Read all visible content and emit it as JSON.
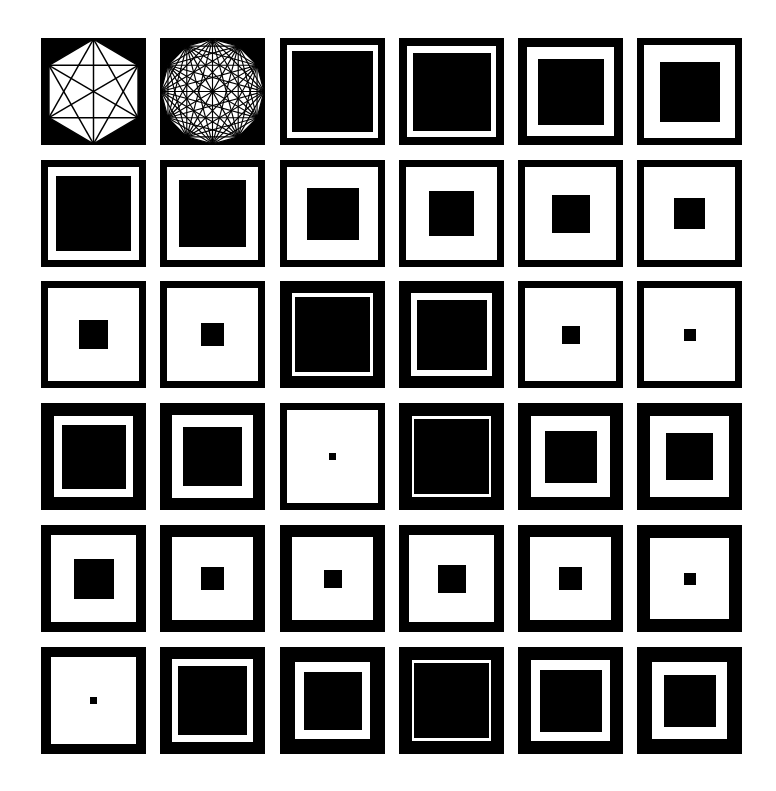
{
  "figure": {
    "title": "",
    "colors": {
      "ink": "#000000",
      "paper": "#ffffff"
    },
    "layout": {
      "col_x": [
        41,
        160,
        280,
        399,
        518,
        637
      ],
      "row_y": [
        38,
        160,
        281,
        403,
        525,
        647
      ],
      "cell_w": 105,
      "cell_h": 107
    },
    "cells": [
      [
        {
          "type": "polygon",
          "sides": 6,
          "label": "hexagon-with-diagonals"
        },
        {
          "type": "polygon",
          "sides": 12,
          "label": "dodecagon-with-diagonals"
        },
        {
          "type": "square",
          "border": 7,
          "inner": 81
        },
        {
          "type": "square",
          "border": 8,
          "inner": 78
        },
        {
          "type": "square",
          "border": 9,
          "inner": 66
        },
        {
          "type": "square",
          "border": 7,
          "inner": 60
        }
      ],
      [
        {
          "type": "square",
          "border": 7,
          "inner": 75
        },
        {
          "type": "square",
          "border": 7,
          "inner": 67
        },
        {
          "type": "square",
          "border": 7,
          "inner": 52
        },
        {
          "type": "square",
          "border": 7,
          "inner": 45
        },
        {
          "type": "square",
          "border": 7,
          "inner": 38
        },
        {
          "type": "square",
          "border": 7,
          "inner": 31
        }
      ],
      [
        {
          "type": "square",
          "border": 7,
          "inner": 29
        },
        {
          "type": "square",
          "border": 7,
          "inner": 23
        },
        {
          "type": "square",
          "border": 12,
          "inner": 75
        },
        {
          "type": "square",
          "border": 12,
          "inner": 70
        },
        {
          "type": "square",
          "border": 7,
          "inner": 18
        },
        {
          "type": "square",
          "border": 7,
          "inner": 12
        }
      ],
      [
        {
          "type": "square",
          "border": 13,
          "inner": 64
        },
        {
          "type": "square",
          "border": 12,
          "inner": 59
        },
        {
          "type": "square",
          "border": 7,
          "inner": 7
        },
        {
          "type": "square",
          "border": 13,
          "inner": 75
        },
        {
          "type": "square",
          "border": 13,
          "inner": 52
        },
        {
          "type": "square",
          "border": 13,
          "inner": 47
        }
      ],
      [
        {
          "type": "square",
          "border": 10,
          "inner": 40
        },
        {
          "type": "square",
          "border": 12,
          "inner": 23
        },
        {
          "type": "square",
          "border": 12,
          "inner": 18
        },
        {
          "type": "square",
          "border": 10,
          "inner": 28
        },
        {
          "type": "square",
          "border": 12,
          "inner": 23
        },
        {
          "type": "square",
          "border": 13,
          "inner": 12
        }
      ],
      [
        {
          "type": "square",
          "border": 10,
          "inner": 7
        },
        {
          "type": "square",
          "border": 12,
          "inner": 69
        },
        {
          "type": "square",
          "border": 15,
          "inner": 58
        },
        {
          "type": "square",
          "border": 13,
          "inner": 75
        },
        {
          "type": "square",
          "border": 13,
          "inner": 62
        },
        {
          "type": "square",
          "border": 15,
          "inner": 52
        }
      ]
    ]
  }
}
